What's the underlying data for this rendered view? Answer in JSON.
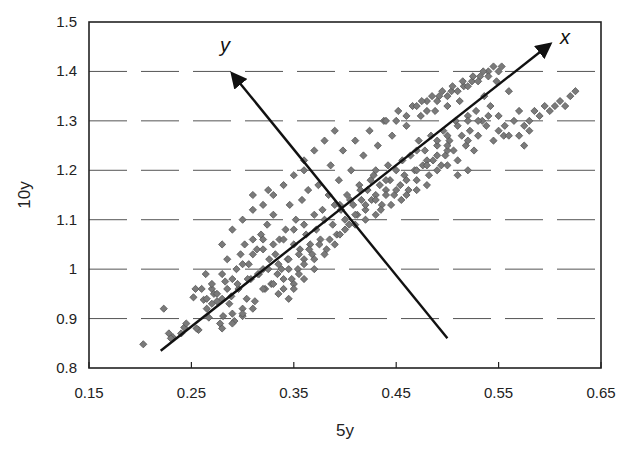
{
  "chart_data": {
    "type": "scatter",
    "title": "",
    "xlabel": "5y",
    "ylabel": "10y",
    "xlim": [
      0.15,
      0.65
    ],
    "ylim": [
      0.8,
      1.5
    ],
    "x_ticks": [
      "0.15",
      "0.25",
      "0.35",
      "0.45",
      "0.55",
      "0.65"
    ],
    "y_ticks": [
      "0.8",
      "0.9",
      "1",
      "1.1",
      "1.2",
      "1.3",
      "1.4",
      "1.5"
    ],
    "grid": {
      "horizontal": true,
      "style": "dashed",
      "vertical": false
    },
    "legend": null,
    "marker": {
      "shape": "diamond",
      "color": "#7a7a7a",
      "stroke": "#555555"
    },
    "annotations": [
      {
        "type": "arrow",
        "label": "x",
        "from": [
          0.22,
          0.835
        ],
        "to": [
          0.6,
          1.455
        ],
        "label_pos": [
          0.61,
          1.455
        ]
      },
      {
        "type": "arrow",
        "label": "y",
        "from": [
          0.5,
          0.86
        ],
        "to": [
          0.29,
          1.395
        ],
        "label_pos": [
          0.278,
          1.44
        ]
      }
    ],
    "series": [
      {
        "name": "5y vs 10y",
        "points": [
          [
            0.203,
            0.848
          ],
          [
            0.223,
            0.92
          ],
          [
            0.228,
            0.87
          ],
          [
            0.232,
            0.862
          ],
          [
            0.243,
            0.882
          ],
          [
            0.252,
            0.943
          ],
          [
            0.254,
            0.96
          ],
          [
            0.257,
            0.877
          ],
          [
            0.262,
            0.938
          ],
          [
            0.264,
            0.99
          ],
          [
            0.267,
            0.902
          ],
          [
            0.27,
            0.96
          ],
          [
            0.272,
            0.95
          ],
          [
            0.275,
            0.935
          ],
          [
            0.278,
            0.89
          ],
          [
            0.281,
            0.905
          ],
          [
            0.283,
            0.975
          ],
          [
            0.285,
            1.02
          ],
          [
            0.287,
            0.93
          ],
          [
            0.289,
            0.945
          ],
          [
            0.292,
            0.895
          ],
          [
            0.294,
            1.0
          ],
          [
            0.296,
            0.96
          ],
          [
            0.298,
            1.03
          ],
          [
            0.3,
            0.905
          ],
          [
            0.302,
            1.05
          ],
          [
            0.304,
            0.94
          ],
          [
            0.306,
            1.01
          ],
          [
            0.308,
            0.98
          ],
          [
            0.31,
            1.06
          ],
          [
            0.312,
            0.935
          ],
          [
            0.314,
            1.04
          ],
          [
            0.316,
            0.99
          ],
          [
            0.318,
            1.07
          ],
          [
            0.32,
            1.0
          ],
          [
            0.322,
            0.96
          ],
          [
            0.324,
            1.09
          ],
          [
            0.326,
            1.02
          ],
          [
            0.328,
            0.97
          ],
          [
            0.33,
            1.11
          ],
          [
            0.332,
            1.03
          ],
          [
            0.334,
            0.99
          ],
          [
            0.336,
            1.06
          ],
          [
            0.338,
            1.0
          ],
          [
            0.34,
            0.96
          ],
          [
            0.342,
            1.08
          ],
          [
            0.344,
            1.02
          ],
          [
            0.346,
            1.13
          ],
          [
            0.348,
            0.98
          ],
          [
            0.35,
            1.05
          ],
          [
            0.352,
            1.1
          ],
          [
            0.354,
            1.0
          ],
          [
            0.356,
            1.04
          ],
          [
            0.358,
            1.14
          ],
          [
            0.36,
            1.02
          ],
          [
            0.362,
            1.07
          ],
          [
            0.364,
            1.16
          ],
          [
            0.366,
            1.05
          ],
          [
            0.368,
            1.03
          ],
          [
            0.37,
            1.11
          ],
          [
            0.372,
            1.08
          ],
          [
            0.374,
            1.17
          ],
          [
            0.376,
            1.06
          ],
          [
            0.378,
            1.12
          ],
          [
            0.38,
            1.1
          ],
          [
            0.382,
            1.04
          ],
          [
            0.384,
            1.15
          ],
          [
            0.386,
            1.21
          ],
          [
            0.388,
            1.09
          ],
          [
            0.39,
            1.13
          ],
          [
            0.392,
            1.07
          ],
          [
            0.394,
            1.18
          ],
          [
            0.396,
            1.12
          ],
          [
            0.398,
            1.24
          ],
          [
            0.4,
            1.1
          ],
          [
            0.402,
            1.15
          ],
          [
            0.404,
            1.09
          ],
          [
            0.406,
            1.2
          ],
          [
            0.408,
            1.13
          ],
          [
            0.41,
            1.26
          ],
          [
            0.412,
            1.11
          ],
          [
            0.414,
            1.17
          ],
          [
            0.416,
            1.14
          ],
          [
            0.418,
            1.23
          ],
          [
            0.42,
            1.12
          ],
          [
            0.422,
            1.16
          ],
          [
            0.424,
            1.28
          ],
          [
            0.426,
            1.14
          ],
          [
            0.428,
            1.19
          ],
          [
            0.43,
            1.15
          ],
          [
            0.432,
            1.25
          ],
          [
            0.434,
            1.17
          ],
          [
            0.436,
            1.13
          ],
          [
            0.438,
            1.3
          ],
          [
            0.44,
            1.16
          ],
          [
            0.442,
            1.21
          ],
          [
            0.444,
            1.18
          ],
          [
            0.446,
            1.27
          ],
          [
            0.448,
            1.15
          ],
          [
            0.45,
            1.2
          ],
          [
            0.452,
            1.32
          ],
          [
            0.454,
            1.17
          ],
          [
            0.456,
            1.22
          ],
          [
            0.458,
            1.19
          ],
          [
            0.46,
            1.29
          ],
          [
            0.462,
            1.16
          ],
          [
            0.464,
            1.23
          ],
          [
            0.466,
            1.33
          ],
          [
            0.468,
            1.2
          ],
          [
            0.47,
            1.18
          ],
          [
            0.472,
            1.26
          ],
          [
            0.474,
            1.31
          ],
          [
            0.476,
            1.21
          ],
          [
            0.478,
            1.24
          ],
          [
            0.48,
            1.34
          ],
          [
            0.482,
            1.19
          ],
          [
            0.484,
            1.27
          ],
          [
            0.486,
            1.22
          ],
          [
            0.488,
            1.32
          ],
          [
            0.49,
            1.25
          ],
          [
            0.492,
            1.35
          ],
          [
            0.494,
            1.21
          ],
          [
            0.496,
            1.28
          ],
          [
            0.498,
            1.23
          ],
          [
            0.5,
            1.33
          ],
          [
            0.502,
            1.26
          ],
          [
            0.504,
            1.36
          ],
          [
            0.506,
            1.24
          ],
          [
            0.508,
            1.3
          ],
          [
            0.51,
            1.22
          ],
          [
            0.512,
            1.34
          ],
          [
            0.514,
            1.27
          ],
          [
            0.516,
            1.37
          ],
          [
            0.518,
            1.25
          ],
          [
            0.52,
            1.31
          ],
          [
            0.522,
            1.28
          ],
          [
            0.524,
            1.38
          ],
          [
            0.526,
            1.24
          ],
          [
            0.528,
            1.32
          ],
          [
            0.53,
            1.27
          ],
          [
            0.532,
            1.39
          ],
          [
            0.534,
            1.3
          ],
          [
            0.536,
            1.35
          ],
          [
            0.538,
            1.29
          ],
          [
            0.54,
            1.4
          ],
          [
            0.542,
            1.33
          ],
          [
            0.545,
            1.26
          ],
          [
            0.548,
            1.38
          ],
          [
            0.55,
            1.31
          ],
          [
            0.553,
            1.41
          ],
          [
            0.556,
            1.29
          ],
          [
            0.56,
            1.36
          ],
          [
            0.565,
            1.3
          ],
          [
            0.57,
            1.32
          ],
          [
            0.575,
            1.29
          ],
          [
            0.58,
            1.3
          ],
          [
            0.585,
            1.32
          ],
          [
            0.59,
            1.31
          ],
          [
            0.595,
            1.33
          ],
          [
            0.6,
            1.32
          ],
          [
            0.605,
            1.33
          ],
          [
            0.61,
            1.34
          ],
          [
            0.615,
            1.33
          ],
          [
            0.62,
            1.35
          ],
          [
            0.625,
            1.36
          ],
          [
            0.575,
            1.25
          ],
          [
            0.555,
            1.27
          ],
          [
            0.52,
            1.2
          ],
          [
            0.51,
            1.19
          ],
          [
            0.5,
            1.21
          ],
          [
            0.49,
            1.2
          ],
          [
            0.48,
            1.17
          ],
          [
            0.47,
            1.16
          ],
          [
            0.46,
            1.15
          ],
          [
            0.455,
            1.14
          ],
          [
            0.445,
            1.13
          ],
          [
            0.435,
            1.12
          ],
          [
            0.43,
            1.11
          ],
          [
            0.42,
            1.1
          ],
          [
            0.41,
            1.09
          ],
          [
            0.4,
            1.08
          ],
          [
            0.395,
            1.07
          ],
          [
            0.385,
            1.06
          ],
          [
            0.375,
            1.05
          ],
          [
            0.365,
            1.04
          ],
          [
            0.355,
            1.03
          ],
          [
            0.345,
            1.02
          ],
          [
            0.335,
            1.01
          ],
          [
            0.325,
            1.0
          ],
          [
            0.315,
            0.99
          ],
          [
            0.305,
            0.98
          ],
          [
            0.295,
            0.97
          ],
          [
            0.285,
            0.96
          ],
          [
            0.275,
            0.95
          ],
          [
            0.265,
            0.94
          ],
          [
            0.33,
            1.15
          ],
          [
            0.34,
            1.17
          ],
          [
            0.35,
            1.19
          ],
          [
            0.36,
            1.22
          ],
          [
            0.37,
            1.24
          ],
          [
            0.32,
            1.13
          ],
          [
            0.31,
            1.12
          ],
          [
            0.3,
            1.1
          ],
          [
            0.29,
            1.08
          ],
          [
            0.28,
            1.05
          ],
          [
            0.31,
            1.15
          ],
          [
            0.325,
            1.16
          ],
          [
            0.36,
            1.2
          ],
          [
            0.38,
            1.26
          ],
          [
            0.39,
            1.28
          ],
          [
            0.44,
            1.3
          ],
          [
            0.45,
            1.3
          ],
          [
            0.46,
            1.31
          ],
          [
            0.47,
            1.33
          ],
          [
            0.48,
            1.32
          ],
          [
            0.49,
            1.34
          ],
          [
            0.5,
            1.35
          ],
          [
            0.51,
            1.36
          ],
          [
            0.52,
            1.37
          ],
          [
            0.53,
            1.38
          ],
          [
            0.54,
            1.39
          ],
          [
            0.55,
            1.4
          ],
          [
            0.545,
            1.41
          ],
          [
            0.535,
            1.4
          ],
          [
            0.525,
            1.39
          ],
          [
            0.515,
            1.38
          ],
          [
            0.505,
            1.37
          ],
          [
            0.495,
            1.36
          ],
          [
            0.485,
            1.35
          ],
          [
            0.475,
            1.34
          ],
          [
            0.47,
            1.24
          ],
          [
            0.48,
            1.22
          ],
          [
            0.49,
            1.26
          ],
          [
            0.5,
            1.27
          ],
          [
            0.51,
            1.29
          ],
          [
            0.52,
            1.3
          ],
          [
            0.53,
            1.3
          ],
          [
            0.54,
            1.31
          ],
          [
            0.55,
            1.28
          ],
          [
            0.56,
            1.27
          ],
          [
            0.57,
            1.27
          ],
          [
            0.58,
            1.28
          ],
          [
            0.52,
            1.26
          ],
          [
            0.5,
            1.24
          ],
          [
            0.44,
            1.18
          ],
          [
            0.43,
            1.2
          ],
          [
            0.425,
            1.18
          ],
          [
            0.415,
            1.16
          ],
          [
            0.405,
            1.14
          ],
          [
            0.395,
            1.13
          ],
          [
            0.36,
            1.09
          ],
          [
            0.35,
            1.08
          ],
          [
            0.34,
            1.06
          ],
          [
            0.33,
            1.05
          ],
          [
            0.32,
            1.04
          ],
          [
            0.345,
            1.0
          ],
          [
            0.355,
            0.99
          ],
          [
            0.35,
            0.97
          ],
          [
            0.34,
            0.98
          ],
          [
            0.33,
            0.97
          ],
          [
            0.32,
            0.96
          ],
          [
            0.335,
            0.95
          ],
          [
            0.36,
            1.01
          ],
          [
            0.37,
            1.02
          ],
          [
            0.38,
            1.03
          ],
          [
            0.39,
            1.05
          ],
          [
            0.37,
            1.0
          ],
          [
            0.36,
            0.98
          ],
          [
            0.35,
            0.96
          ],
          [
            0.345,
            0.94
          ],
          [
            0.3,
            0.92
          ],
          [
            0.29,
            0.91
          ],
          [
            0.28,
            0.88
          ],
          [
            0.29,
            0.89
          ],
          [
            0.3,
            0.91
          ],
          [
            0.31,
            0.92
          ],
          [
            0.28,
            0.99
          ],
          [
            0.27,
            0.97
          ],
          [
            0.26,
            0.96
          ],
          [
            0.255,
            0.88
          ],
          [
            0.23,
            0.86
          ],
          [
            0.24,
            0.87
          ],
          [
            0.245,
            0.89
          ],
          [
            0.265,
            0.92
          ],
          [
            0.27,
            0.93
          ],
          [
            0.28,
            0.94
          ],
          [
            0.29,
            0.98
          ],
          [
            0.3,
            1.01
          ],
          [
            0.31,
            1.03
          ],
          [
            0.32,
            1.06
          ],
          [
            0.41,
            1.11
          ],
          [
            0.42,
            1.13
          ],
          [
            0.43,
            1.14
          ],
          [
            0.44,
            1.15
          ],
          [
            0.45,
            1.16
          ],
          [
            0.46,
            1.18
          ],
          [
            0.47,
            1.2
          ],
          [
            0.48,
            1.21
          ],
          [
            0.49,
            1.23
          ],
          [
            0.5,
            1.25
          ]
        ]
      }
    ]
  }
}
